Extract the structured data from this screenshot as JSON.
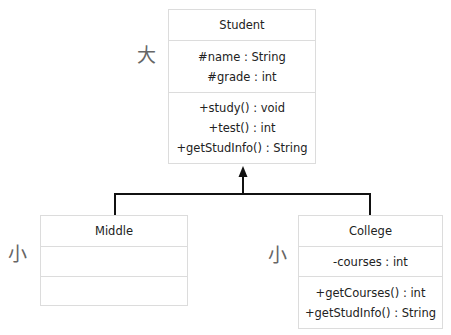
{
  "diagram": {
    "type": "UML class diagram (inheritance)",
    "classes": [
      {
        "name": "Student",
        "size_label": "大",
        "attributes": [
          "#name : String",
          "#grade : int"
        ],
        "methods": [
          "+study() : void",
          "+test() : int",
          "+getStudInfo() : String"
        ]
      },
      {
        "name": "Middle",
        "size_label": "小",
        "attributes": [],
        "methods": []
      },
      {
        "name": "College",
        "size_label": "小",
        "attributes": [
          "-courses : int"
        ],
        "methods": [
          "+getCourses() : int",
          "+getStudInfo() : String"
        ]
      }
    ],
    "relations": [
      {
        "from": "Middle",
        "to": "Student",
        "kind": "generalization"
      },
      {
        "from": "College",
        "to": "Student",
        "kind": "generalization"
      }
    ],
    "colors": {
      "box_border": "#dcdcdc",
      "line": "#111111",
      "label": "#666666"
    }
  }
}
